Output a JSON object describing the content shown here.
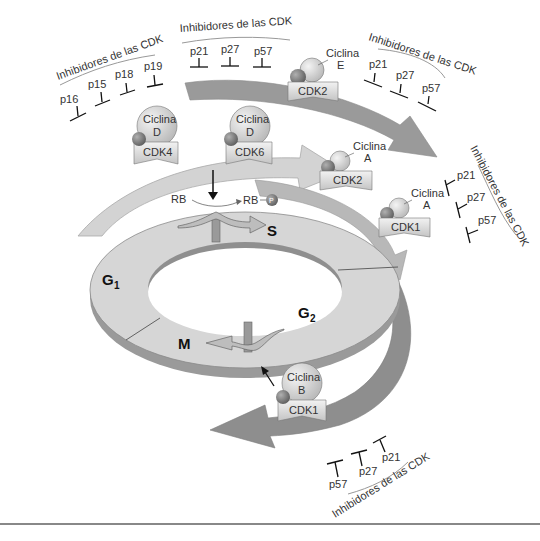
{
  "phases": {
    "g1": {
      "label": "G",
      "sub": "1"
    },
    "s": {
      "label": "S"
    },
    "g2": {
      "label": "G",
      "sub": "2"
    },
    "m": {
      "label": "M"
    }
  },
  "rb": {
    "left": "RB",
    "right": "RB",
    "phospho": "P"
  },
  "complexes": [
    {
      "cyclin": "Ciclina",
      "cyclin_letter": "D",
      "cdk": "CDK4"
    },
    {
      "cyclin": "Ciclina",
      "cyclin_letter": "D",
      "cdk": "CDK6"
    },
    {
      "cyclin": "Ciclina",
      "cyclin_letter": "E",
      "cdk": "CDK2"
    },
    {
      "cyclin": "Ciclina",
      "cyclin_letter": "A",
      "cdk": "CDK2"
    },
    {
      "cyclin": "Ciclina",
      "cyclin_letter": "A",
      "cdk": "CDK1"
    },
    {
      "cyclin": "Ciclina",
      "cyclin_letter": "B",
      "cdk": "CDK1"
    }
  ],
  "inhibitor_groups": [
    {
      "title": "Inhibidores de las CDK",
      "items": [
        "p16",
        "p15",
        "p18",
        "p19"
      ]
    },
    {
      "title": "Inhibidores de las CDK",
      "items": [
        "p21",
        "p27",
        "p57"
      ]
    },
    {
      "title": "Inhibidores de las CDK",
      "items": [
        "p21",
        "p27",
        "p57"
      ]
    },
    {
      "title": "Inhibidores de las CDK",
      "items": [
        "p21",
        "p27",
        "p57"
      ]
    },
    {
      "title": "Inhibidores de las CDK",
      "items": [
        "p57",
        "p27",
        "p21"
      ]
    }
  ],
  "colors": {
    "light_arrow": "#d3d3d3",
    "mid_arrow": "#b8b8b8",
    "dark_arrow": "#8e8e8e",
    "ring_top": "#d6d6d6",
    "ring_side": "#9a9a9a",
    "cyclin": "#d8d8d8",
    "kinase_ball": "#7a7a7a"
  }
}
